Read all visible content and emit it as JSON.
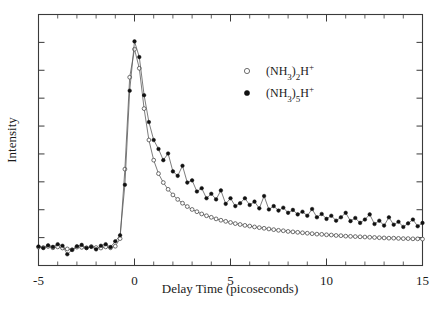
{
  "chart_data": {
    "type": "scatter",
    "title": "",
    "xlabel": "Delay Time (picoseconds)",
    "ylabel": "Intensity",
    "xlim": [
      -5,
      15
    ],
    "ylim": [
      0,
      1.12
    ],
    "grid": false,
    "legend_position": "upper-right",
    "xticks": [
      -5,
      0,
      5,
      10,
      15
    ],
    "xtick_labels": [
      "-5",
      "0",
      "5",
      "10",
      "15"
    ],
    "ytick_labels": [],
    "x_minor_tick_interval": 1,
    "y_tick_count": 9,
    "series": [
      {
        "name": "(NH3)2H+",
        "label_html": "(NH<sub>3</sub>)<sub>2</sub>H<sup>+</sup>",
        "marker": "open-circle",
        "color": "#4a4a4a",
        "x": [
          -5.0,
          -4.75,
          -4.5,
          -4.25,
          -4.0,
          -3.75,
          -3.5,
          -3.25,
          -3.0,
          -2.75,
          -2.5,
          -2.25,
          -2.0,
          -1.75,
          -1.5,
          -1.25,
          -1.0,
          -0.75,
          -0.5,
          -0.25,
          0.0,
          0.25,
          0.5,
          0.75,
          1.0,
          1.25,
          1.5,
          1.75,
          2.0,
          2.25,
          2.5,
          2.75,
          3.0,
          3.25,
          3.5,
          3.75,
          4.0,
          4.25,
          4.5,
          4.75,
          5.0,
          5.25,
          5.5,
          5.75,
          6.0,
          6.25,
          6.5,
          6.75,
          7.0,
          7.25,
          7.5,
          7.75,
          8.0,
          8.25,
          8.5,
          8.75,
          9.0,
          9.25,
          9.5,
          9.75,
          10.0,
          10.25,
          10.5,
          10.75,
          11.0,
          11.25,
          11.5,
          11.75,
          12.0,
          12.25,
          12.5,
          12.75,
          13.0,
          13.25,
          13.5,
          13.75,
          14.0,
          14.25,
          14.5,
          14.75,
          15.0
        ],
        "y": [
          0.082,
          0.08,
          0.085,
          0.079,
          0.083,
          0.078,
          0.074,
          0.07,
          0.082,
          0.081,
          0.079,
          0.084,
          0.08,
          0.078,
          0.083,
          0.079,
          0.086,
          0.12,
          0.43,
          0.84,
          0.965,
          0.88,
          0.7,
          0.56,
          0.47,
          0.41,
          0.37,
          0.34,
          0.315,
          0.295,
          0.278,
          0.263,
          0.25,
          0.24,
          0.23,
          0.222,
          0.215,
          0.208,
          0.202,
          0.197,
          0.192,
          0.187,
          0.183,
          0.179,
          0.176,
          0.172,
          0.169,
          0.166,
          0.163,
          0.16,
          0.157,
          0.155,
          0.152,
          0.15,
          0.148,
          0.146,
          0.144,
          0.142,
          0.14,
          0.139,
          0.137,
          0.136,
          0.134,
          0.133,
          0.131,
          0.13,
          0.129,
          0.128,
          0.127,
          0.126,
          0.125,
          0.124,
          0.123,
          0.122,
          0.122,
          0.121,
          0.12,
          0.12,
          0.119,
          0.119,
          0.118
        ]
      },
      {
        "name": "(NH3)5H+",
        "label_html": "(NH<sub>3</sub>)<sub>5</sub>H<sup>+</sup>",
        "marker": "filled-circle",
        "color": "#111111",
        "x": [
          -5.0,
          -4.75,
          -4.5,
          -4.25,
          -4.0,
          -3.75,
          -3.5,
          -3.25,
          -3.0,
          -2.75,
          -2.5,
          -2.25,
          -2.0,
          -1.75,
          -1.5,
          -1.25,
          -1.0,
          -0.75,
          -0.5,
          -0.25,
          0.0,
          0.25,
          0.5,
          0.75,
          1.0,
          1.25,
          1.5,
          1.75,
          2.0,
          2.25,
          2.5,
          2.75,
          3.0,
          3.25,
          3.5,
          3.75,
          4.0,
          4.25,
          4.5,
          4.75,
          5.0,
          5.25,
          5.5,
          5.75,
          6.0,
          6.25,
          6.5,
          6.75,
          7.0,
          7.25,
          7.5,
          7.75,
          8.0,
          8.25,
          8.5,
          8.75,
          9.0,
          9.25,
          9.5,
          9.75,
          10.0,
          10.25,
          10.5,
          10.75,
          11.0,
          11.25,
          11.5,
          11.75,
          12.0,
          12.25,
          12.5,
          12.75,
          13.0,
          13.25,
          13.5,
          13.75,
          14.0,
          14.25,
          14.5,
          14.75,
          15.0
        ],
        "y": [
          0.085,
          0.078,
          0.09,
          0.083,
          0.095,
          0.088,
          0.05,
          0.07,
          0.086,
          0.092,
          0.078,
          0.084,
          0.072,
          0.088,
          0.095,
          0.082,
          0.108,
          0.135,
          0.36,
          0.78,
          1.0,
          0.93,
          0.76,
          0.64,
          0.56,
          0.52,
          0.47,
          0.5,
          0.42,
          0.4,
          0.445,
          0.37,
          0.38,
          0.33,
          0.345,
          0.3,
          0.32,
          0.295,
          0.335,
          0.275,
          0.3,
          0.265,
          0.278,
          0.3,
          0.27,
          0.285,
          0.255,
          0.31,
          0.25,
          0.265,
          0.245,
          0.258,
          0.235,
          0.248,
          0.228,
          0.24,
          0.222,
          0.252,
          0.215,
          0.23,
          0.208,
          0.222,
          0.2,
          0.215,
          0.235,
          0.198,
          0.212,
          0.19,
          0.205,
          0.228,
          0.185,
          0.2,
          0.178,
          0.215,
          0.182,
          0.195,
          0.172,
          0.188,
          0.205,
          0.175,
          0.19
        ]
      }
    ]
  },
  "axes": {
    "x_label": "Delay Time (picoseconds)",
    "y_label": "Intensity"
  }
}
